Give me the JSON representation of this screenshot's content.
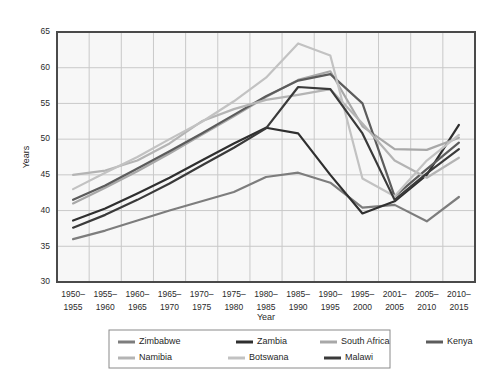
{
  "chart_data": {
    "type": "line",
    "title": "",
    "xlabel": "Year",
    "ylabel": "Years",
    "ylim": [
      30,
      65
    ],
    "yticks": [
      30,
      35,
      40,
      45,
      50,
      55,
      60,
      65
    ],
    "grid": true,
    "legend_position": "bottom",
    "categories": [
      "1950–\n1955",
      "1955–\n1960",
      "1960–\n1965",
      "1965–\n1970",
      "1970–\n1975",
      "1975–\n1980",
      "1980–\n1985",
      "1985–\n1990",
      "1990–\n1995",
      "1995–\n2000",
      "2001–\n2005",
      "2005–\n2010",
      "2010–\n2015"
    ],
    "categories_top": [
      "1950–",
      "1955–",
      "1960–",
      "1965–",
      "1970–",
      "1975–",
      "1980–",
      "1985–",
      "1990–",
      "1995–",
      "2001–",
      "2005–",
      "2010–"
    ],
    "categories_bottom": [
      "1955",
      "1960",
      "1965",
      "1970",
      "1975",
      "1980",
      "1985",
      "1990",
      "1995",
      "2000",
      "2005",
      "2010",
      "2015"
    ],
    "series": [
      {
        "name": "Zimbabwe",
        "color": "#7d7d7d",
        "values": [
          36.0,
          37.2,
          38.6,
          40.0,
          41.3,
          42.6,
          44.7,
          45.3,
          43.9,
          40.4,
          40.8,
          38.5,
          41.9
        ]
      },
      {
        "name": "Zambia",
        "color": "#2f2f2f",
        "values": [
          38.6,
          40.3,
          42.4,
          44.6,
          47.0,
          49.4,
          51.6,
          50.8,
          45.0,
          39.6,
          41.3,
          45.0,
          52.0
        ]
      },
      {
        "name": "South Africa",
        "color": "#a8a8a8",
        "values": [
          41.0,
          43.2,
          45.5,
          48.0,
          50.6,
          53.2,
          55.9,
          58.3,
          59.5,
          51.8,
          48.6,
          48.5,
          50.2
        ]
      },
      {
        "name": "Kenya",
        "color": "#5c5c5c",
        "values": [
          41.5,
          43.5,
          45.9,
          48.3,
          50.8,
          53.4,
          56.0,
          58.2,
          59.1,
          55.0,
          42.0,
          45.8,
          49.5
        ]
      },
      {
        "name": "Namibia",
        "color": "#b4b4b4",
        "values": [
          45.0,
          45.6,
          47.0,
          49.4,
          52.5,
          54.2,
          55.5,
          56.2,
          57.0,
          52.2,
          47.0,
          44.6,
          47.4
        ]
      },
      {
        "name": "Botswana",
        "color": "#c2c2c2",
        "values": [
          43.0,
          45.3,
          47.5,
          50.0,
          52.4,
          55.3,
          58.6,
          63.4,
          61.7,
          44.5,
          42.0,
          47.0,
          50.6
        ]
      },
      {
        "name": "Malawi",
        "color": "#3a3a3a",
        "values": [
          37.6,
          39.4,
          41.5,
          43.8,
          46.3,
          48.8,
          51.5,
          57.3,
          57.0,
          50.8,
          41.5,
          45.2,
          48.6
        ]
      }
    ]
  },
  "legend": {
    "row1": [
      "Zimbabwe",
      "Zambia",
      "South Africa",
      "Kenya"
    ],
    "row2": [
      "Namibia",
      "Botswana",
      "Malawi"
    ]
  },
  "colors": {
    "plot_background": "#f7f7f7",
    "frame": "#4a4a4a",
    "gridline": "#c9c9c9",
    "text": "#2b2b2b",
    "legend_border": "#8a8a8a"
  }
}
